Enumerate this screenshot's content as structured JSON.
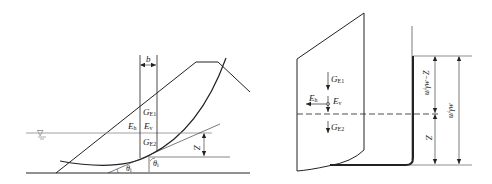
{
  "diagram": {
    "left_panel": {
      "description": "Slope cross-section with circular slip surface and a vertical slice",
      "labels": {
        "slice_width": "b",
        "weight_above": "G",
        "weight_above_sub": "E1",
        "weight_below": "G",
        "weight_below_sub": "E2",
        "horizontal_force": "E",
        "horizontal_force_sub": "h",
        "vertical_force": "E",
        "vertical_force_sub": "v",
        "depth": "Z",
        "angle_base": "θ",
        "angle_base_sub": "i",
        "angle_slice": "θ",
        "angle_slice_sub": "i"
      },
      "water_table_symbol": "▽"
    },
    "right_panel": {
      "description": "Detail of single slice with forces and pore pressure head dimensions",
      "labels": {
        "weight_above": "G",
        "weight_above_sub": "E1",
        "weight_below": "G",
        "weight_below_sub": "E2",
        "horizontal_force": "E",
        "horizontal_force_sub": "h",
        "vertical_force": "E",
        "vertical_force_sub": "v",
        "head_minus_z": "u/γw−Z",
        "head": "u/γw",
        "depth": "Z"
      }
    },
    "colors": {
      "line": "#222222",
      "water_line": "#888888"
    }
  }
}
